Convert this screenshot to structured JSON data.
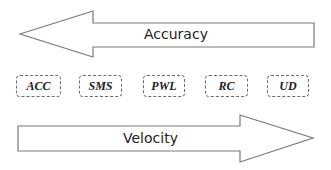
{
  "diagram": {
    "top_arrow": {
      "label": "Accuracy",
      "direction": "left",
      "stroke_color": "#7a7a7a"
    },
    "methods": [
      {
        "label": "ACC"
      },
      {
        "label": "SMS"
      },
      {
        "label": "PWL"
      },
      {
        "label": "RC"
      },
      {
        "label": "UD"
      }
    ],
    "bottom_arrow": {
      "label": "Velocity",
      "direction": "right",
      "stroke_color": "#7a7a7a"
    }
  }
}
